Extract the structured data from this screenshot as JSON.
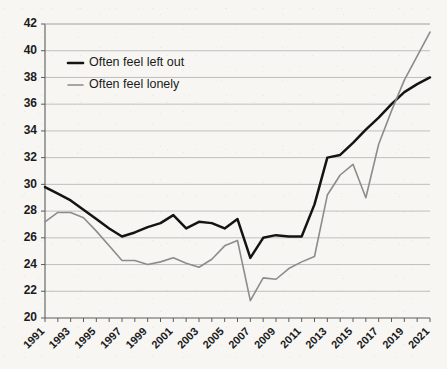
{
  "chart_data": {
    "type": "line",
    "title": "",
    "subtitle": "",
    "xlabel": "",
    "ylabel": "",
    "xlim": [
      1991,
      2021
    ],
    "ylim": [
      20,
      42
    ],
    "ytick_step": 2,
    "yticks": [
      20,
      22,
      24,
      26,
      28,
      30,
      32,
      34,
      36,
      38,
      40,
      42
    ],
    "xticks": [
      1991,
      1993,
      1995,
      1997,
      1999,
      2001,
      2003,
      2005,
      2007,
      2009,
      2011,
      2013,
      2015,
      2017,
      2019,
      2021
    ],
    "x": [
      1991,
      1992,
      1993,
      1994,
      1995,
      1996,
      1997,
      1998,
      1999,
      2000,
      2001,
      2002,
      2003,
      2004,
      2005,
      2006,
      2007,
      2008,
      2009,
      2010,
      2011,
      2012,
      2013,
      2014,
      2015,
      2016,
      2017,
      2018,
      2019,
      2020,
      2021
    ],
    "grid": true,
    "grid_axis": "y",
    "legend_position": "top-left",
    "series": [
      {
        "name": "Often feel left out",
        "color": "#141414",
        "values": [
          29.8,
          29.3,
          28.8,
          28.1,
          27.4,
          26.7,
          26.1,
          26.4,
          26.8,
          27.1,
          27.7,
          26.7,
          27.2,
          27.1,
          26.7,
          27.4,
          24.5,
          26.0,
          26.2,
          26.1,
          26.1,
          28.5,
          32.0,
          32.2,
          33.1,
          34.1,
          35.0,
          36.0,
          36.9,
          37.5,
          38.0
        ]
      },
      {
        "name": "Often feel lonely",
        "color": "#8c8c8c",
        "values": [
          27.2,
          27.9,
          27.9,
          27.5,
          26.5,
          25.4,
          24.3,
          24.3,
          24.0,
          24.2,
          24.5,
          24.1,
          23.8,
          24.4,
          25.4,
          25.8,
          21.3,
          23.0,
          22.9,
          23.7,
          24.2,
          24.6,
          29.2,
          30.7,
          31.5,
          29.0,
          33.0,
          35.5,
          37.8,
          39.6,
          41.4
        ]
      }
    ],
    "legend": [
      {
        "label": "Often feel left out",
        "color": "#141414",
        "weight": "thick"
      },
      {
        "label": "Often feel lonely",
        "color": "#8c8c8c",
        "weight": "thin"
      }
    ]
  },
  "colors": {
    "background": "#f7f6f3",
    "grid": "#b9b9b9",
    "axis": "#5c5c5c",
    "text": "#1b1b1b"
  }
}
